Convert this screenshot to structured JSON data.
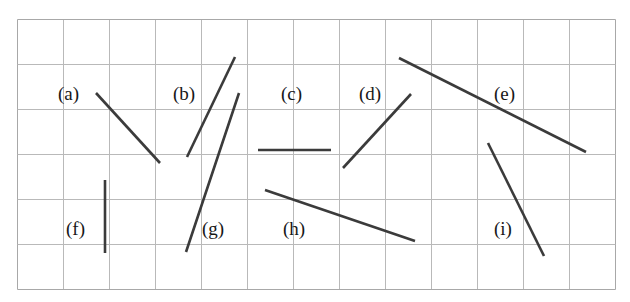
{
  "figure": {
    "background_color": "#ffffff",
    "canvas": {
      "width": 630,
      "height": 302
    },
    "grid": {
      "name": "graph-paper-grid",
      "x": 17,
      "y": 19,
      "cols": 13,
      "rows": 6,
      "cell_width": 46,
      "cell_height": 45,
      "line_color": "#b9b9b9",
      "border_color": "#a8a8a8",
      "line_width": 1
    },
    "segments_style": {
      "color": "#3b3b3b",
      "width": 2.6,
      "cap": "butt"
    },
    "segments": [
      {
        "id": "a",
        "label": "(a)",
        "x1": 96,
        "y1": 93,
        "x2": 160,
        "y2": 163
      },
      {
        "id": "b",
        "label": "(b)",
        "x1": 187,
        "y1": 157,
        "x2": 235,
        "y2": 57
      },
      {
        "id": "c",
        "label": "(c)",
        "x1": 258,
        "y1": 150,
        "x2": 331,
        "y2": 150
      },
      {
        "id": "d",
        "label": "(d)",
        "x1": 343,
        "y1": 168,
        "x2": 411,
        "y2": 94
      },
      {
        "id": "e",
        "label": "(e)",
        "x1": 399,
        "y1": 58,
        "x2": 586,
        "y2": 152
      },
      {
        "id": "f",
        "label": "(f)",
        "x1": 105,
        "y1": 180,
        "x2": 105,
        "y2": 253
      },
      {
        "id": "g",
        "label": "(g)",
        "x1": 186,
        "y1": 252,
        "x2": 239,
        "y2": 93
      },
      {
        "id": "h",
        "label": "(h)",
        "x1": 265,
        "y1": 190,
        "x2": 415,
        "y2": 241
      },
      {
        "id": "i",
        "label": "(i)",
        "x1": 488,
        "y1": 143,
        "x2": 544,
        "y2": 256
      }
    ],
    "labels": [
      {
        "id": "a",
        "text": "(a)",
        "x": 58,
        "y": 84
      },
      {
        "id": "b",
        "text": "(b)",
        "x": 173,
        "y": 84
      },
      {
        "id": "c",
        "text": "(c)",
        "x": 281,
        "y": 84
      },
      {
        "id": "d",
        "text": "(d)",
        "x": 359,
        "y": 84
      },
      {
        "id": "e",
        "text": "(e)",
        "x": 494,
        "y": 84
      },
      {
        "id": "f",
        "text": "(f)",
        "x": 66,
        "y": 219
      },
      {
        "id": "g",
        "text": "(g)",
        "x": 202,
        "y": 219
      },
      {
        "id": "h",
        "text": "(h)",
        "x": 283,
        "y": 219
      },
      {
        "id": "i",
        "text": "(i)",
        "x": 494,
        "y": 219
      }
    ]
  }
}
